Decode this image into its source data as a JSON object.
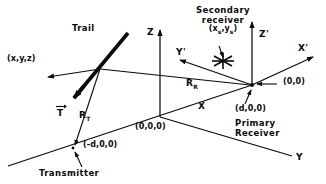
{
  "figure": {
    "ink_color": "#0a0a0a",
    "background_color": "#ffffff"
  },
  "axes": {
    "z": "Z",
    "z_prime": "Z'",
    "x": "X",
    "x_prime": "X'",
    "y": "Y",
    "y_prime": "Y'"
  },
  "labels": {
    "trail": "Trail",
    "trail_point": "(x,y,z)",
    "vector_t": "T",
    "range_transmitter": "R",
    "range_transmitter_sub": "T",
    "range_receiver": "R",
    "range_receiver_sub": "R",
    "origin": "(0,0,0)",
    "transmitter_coord": "(-d,0,0)",
    "transmitter": "Transmitter",
    "primary_coord": "(d,0,0)",
    "primary_receiver_line1": "Primary",
    "primary_receiver_line2": "Receiver",
    "primary_origin_2d": "(0,0)",
    "secondary_line1": "Secondary",
    "secondary_line2": "receiver",
    "secondary_coord_open": "(x",
    "secondary_coord_sub1": "s",
    "secondary_coord_mid": ",y",
    "secondary_coord_sub2": "s",
    "secondary_coord_close": ")"
  },
  "icons": {
    "secondary_marker": "asterisk-star-icon",
    "vector_arrow": "vector-overbar-arrow-icon"
  }
}
